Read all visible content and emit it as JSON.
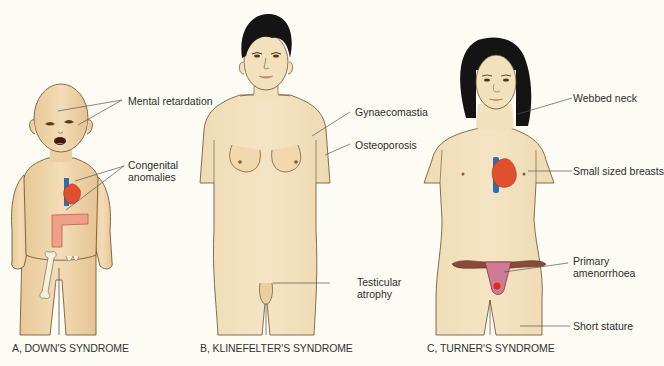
{
  "figure": {
    "panels": [
      {
        "id": "A",
        "caption": "A, DOWN'S SYNDROME",
        "annotations": [
          {
            "text": "Mental retardation"
          },
          {
            "text": "Congenital\nanomalies"
          }
        ]
      },
      {
        "id": "B",
        "caption": "B, KLINEFELTER'S SYNDROME",
        "annotations": [
          {
            "text": "Gynaecomastia"
          },
          {
            "text": "Osteoporosis"
          },
          {
            "text": "Testicular\natrophy"
          }
        ]
      },
      {
        "id": "C",
        "caption": "C, TURNER'S SYNDROME",
        "annotations": [
          {
            "text": "Webbed neck"
          },
          {
            "text": "Small sized breasts"
          },
          {
            "text": "Primary\namenorrhoea"
          },
          {
            "text": "Short stature"
          }
        ]
      }
    ],
    "colors": {
      "background": "#fdfcf4",
      "skin": "#f1dcb4",
      "skin_outline": "#6b4a2a",
      "hair": "#141414",
      "heart": "#e0502e",
      "vessel": "#2a6fb5",
      "bowel": "#f0a088",
      "bone": "#f6f1dc",
      "uterus": "#cf7b98",
      "tube": "#8a4a3a",
      "leader_line": "#555555"
    }
  }
}
